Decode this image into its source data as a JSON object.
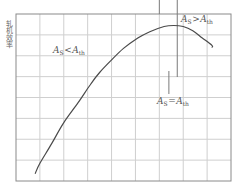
{
  "chart_data": {
    "type": "line",
    "title": "",
    "xlabel": "",
    "ylabel": "轧机效率",
    "grid": true,
    "x_grid_divisions": 9,
    "y_grid_divisions": 8,
    "xlim": [
      0,
      9
    ],
    "ylim": [
      0,
      8
    ],
    "series": [
      {
        "name": "efficiency",
        "x": [
          0.8,
          1.0,
          1.5,
          2.0,
          2.6,
          3.1,
          3.5,
          4.0,
          4.5,
          5.1,
          5.6,
          6.2,
          6.6,
          7.0,
          7.4,
          7.8,
          8.2,
          8.2
        ],
        "y": [
          0.35,
          0.85,
          1.8,
          2.8,
          3.75,
          4.6,
          5.2,
          5.8,
          6.35,
          6.85,
          7.15,
          7.4,
          7.45,
          7.4,
          7.2,
          6.85,
          6.5,
          6.4
        ]
      }
    ],
    "annotations": [
      {
        "text": "A_S<A_th",
        "region": "left of optimum (rising branch)"
      },
      {
        "text": "A_S>A_th",
        "region": "right of optimum (falling branch)"
      },
      {
        "text": "A_S=A_th",
        "region": "optimum point marker"
      }
    ],
    "markers": {
      "vertical_lines_x": [
        6.0,
        6.75
      ],
      "optimum_tick_x": 6.4
    }
  },
  "labels": {
    "ylabel": "轧机效率",
    "ann_left": {
      "main": "A",
      "sub": "S",
      "op": "<",
      "main2": "A",
      "sub2": "th"
    },
    "ann_right": {
      "main": "A",
      "sub": "S",
      "op": ">",
      "main2": "A",
      "sub2": "th"
    },
    "ann_mid": {
      "main": "A",
      "sub": "S",
      "op": "=",
      "main2": "A",
      "sub2": "th"
    }
  },
  "colors": {
    "background": "#ffffff",
    "grid": "#cfcfcf",
    "frame": "#8a8a8a",
    "curve": "#4a4a4a",
    "marker": "#7a7a7a"
  }
}
